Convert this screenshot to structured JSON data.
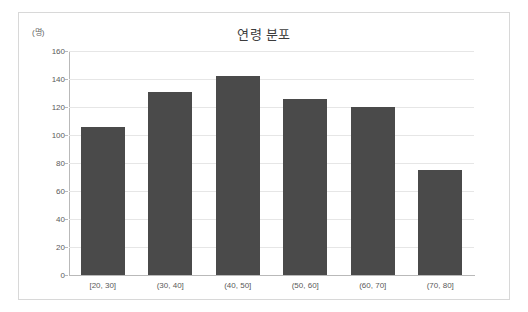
{
  "chart_data": {
    "type": "bar",
    "title": "연령 분포",
    "xlabel": "",
    "ylabel": "",
    "unit_label": "(명)",
    "categories": [
      "[20, 30]",
      "(30, 40]",
      "(40, 50]",
      "(50, 60]",
      "(60, 70]",
      "(70, 80]"
    ],
    "values": [
      106,
      131,
      142,
      126,
      120,
      75
    ],
    "ylim": [
      0,
      160
    ],
    "yticks": [
      0,
      20,
      40,
      60,
      80,
      100,
      120,
      140,
      160
    ],
    "ytick_labels": [
      "0",
      "20",
      "40",
      "60",
      "80",
      "100",
      "120",
      "140",
      "160"
    ],
    "grid": true,
    "legend": false,
    "bar_color": "#4a4a4a",
    "gridline_color": "#e6e6e6",
    "axis_color": "#b9b9b9",
    "panel_border_color": "#d8d8d8",
    "background_color": "#ffffff"
  }
}
